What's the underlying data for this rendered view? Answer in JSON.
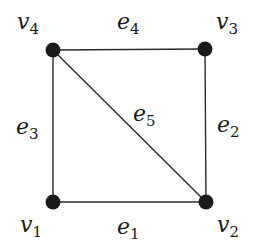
{
  "diagram": {
    "type": "graph",
    "title": "",
    "vertices": [
      {
        "id": "v1",
        "name": "v",
        "sub": "1",
        "x": 53,
        "y": 202,
        "label_x": 20,
        "label_y": 232
      },
      {
        "id": "v2",
        "name": "v",
        "sub": "2",
        "x": 206,
        "y": 202,
        "label_x": 217,
        "label_y": 232
      },
      {
        "id": "v3",
        "name": "v",
        "sub": "3",
        "x": 205,
        "y": 49,
        "label_x": 216,
        "label_y": 29
      },
      {
        "id": "v4",
        "name": "v",
        "sub": "4",
        "x": 53,
        "y": 50,
        "label_x": 17,
        "label_y": 29
      }
    ],
    "edges": [
      {
        "id": "e1",
        "name": "e",
        "sub": "1",
        "from": "v1",
        "to": "v2",
        "label_x": 117,
        "label_y": 234
      },
      {
        "id": "e2",
        "name": "e",
        "sub": "2",
        "from": "v2",
        "to": "v3",
        "label_x": 217,
        "label_y": 132
      },
      {
        "id": "e3",
        "name": "e",
        "sub": "3",
        "from": "v1",
        "to": "v4",
        "label_x": 16,
        "label_y": 134
      },
      {
        "id": "e4",
        "name": "e",
        "sub": "4",
        "from": "v4",
        "to": "v3",
        "label_x": 117,
        "label_y": 29
      },
      {
        "id": "e5",
        "name": "e",
        "sub": "5",
        "from": "v4",
        "to": "v2",
        "label_x": 133,
        "label_y": 121
      }
    ],
    "colors": {
      "edge": "#2a2a2a",
      "vertex": "#1a1a1a",
      "background": "#ffffff"
    }
  }
}
